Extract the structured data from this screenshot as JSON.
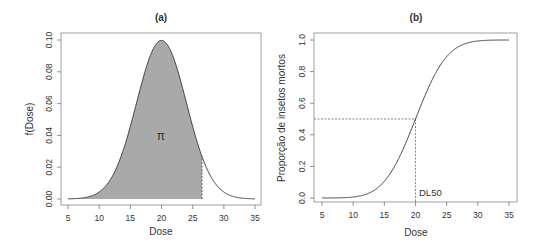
{
  "chart_data": [
    {
      "type": "area",
      "title": "(a)",
      "xlabel": "Dose",
      "ylabel": "f(Dose)",
      "xlim": [
        5,
        35
      ],
      "ylim": [
        0,
        0.1
      ],
      "xticks": [
        "5",
        "10",
        "15",
        "20",
        "25",
        "30",
        "35"
      ],
      "yticks": [
        "0.00",
        "0.02",
        "0.04",
        "0.06",
        "0.08",
        "0.10"
      ],
      "grid": false,
      "distribution": {
        "kind": "normal",
        "mean": 20,
        "sd": 4
      },
      "x": [
        5,
        8,
        10,
        12,
        14,
        16,
        18,
        20,
        22,
        24,
        26,
        28,
        30,
        32,
        35
      ],
      "values": [
        0.0004,
        0.0011,
        0.0044,
        0.0135,
        0.0324,
        0.0605,
        0.088,
        0.0997,
        0.088,
        0.0605,
        0.0324,
        0.0135,
        0.0044,
        0.0011,
        0.0001
      ],
      "shaded_region": {
        "from": 5,
        "to": 26.5,
        "color": "#a9a9a9"
      },
      "cutoff_x": 26.5,
      "annotations": [
        {
          "text": "π",
          "x": 20,
          "y": 0.04
        }
      ]
    },
    {
      "type": "line",
      "title": "(b)",
      "xlabel": "Dose",
      "ylabel": "Proporção de insetos mortos",
      "xlim": [
        5,
        35
      ],
      "ylim": [
        0,
        1.0
      ],
      "xticks": [
        "5",
        "10",
        "15",
        "20",
        "25",
        "30",
        "35"
      ],
      "yticks": [
        "0.0",
        "0.2",
        "0.4",
        "0.6",
        "0.8",
        "1.0"
      ],
      "grid": false,
      "x": [
        5,
        8,
        10,
        12,
        14,
        16,
        18,
        20,
        22,
        24,
        26,
        28,
        30,
        32,
        35
      ],
      "values": [
        0.0001,
        0.0013,
        0.0062,
        0.0228,
        0.0668,
        0.1587,
        0.3085,
        0.5,
        0.6915,
        0.8413,
        0.9332,
        0.9772,
        0.9938,
        0.9987,
        0.9999
      ],
      "reference_lines": [
        {
          "type": "horizontal",
          "y": 0.5,
          "from_x": 5,
          "to_x": 20,
          "style": "dashed"
        },
        {
          "type": "vertical",
          "x": 20,
          "from_y": 0,
          "to_y": 0.5,
          "style": "dashed"
        }
      ],
      "annotations": [
        {
          "text": "DL50",
          "x": 20,
          "y": 0.03
        }
      ]
    }
  ],
  "panels": {
    "a": {
      "title": "(a)",
      "xlabel": "Dose",
      "ylabel": "f(Dose)",
      "pi_label": "π"
    },
    "b": {
      "title": "(b)",
      "xlabel": "Dose",
      "ylabel": "Proporção de insetos mortos",
      "dl50_label": "DL50"
    }
  }
}
